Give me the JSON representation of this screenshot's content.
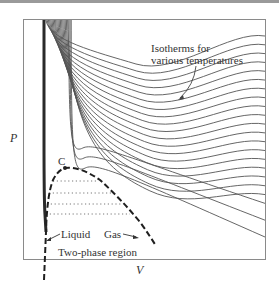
{
  "diagram": {
    "axes": {
      "x_label": "V",
      "y_label": "P"
    },
    "annotations": {
      "isotherms_line1": "Isotherms for",
      "isotherms_line2": "various temperatures",
      "critical_point": "C",
      "liquid": "Liquid",
      "gas": "Gas",
      "two_phase": "Two-phase region"
    },
    "colors": {
      "curve": "#555555",
      "frame": "#888888",
      "dome": "#222222",
      "text": "#333333"
    },
    "isotherm_count": 22
  }
}
